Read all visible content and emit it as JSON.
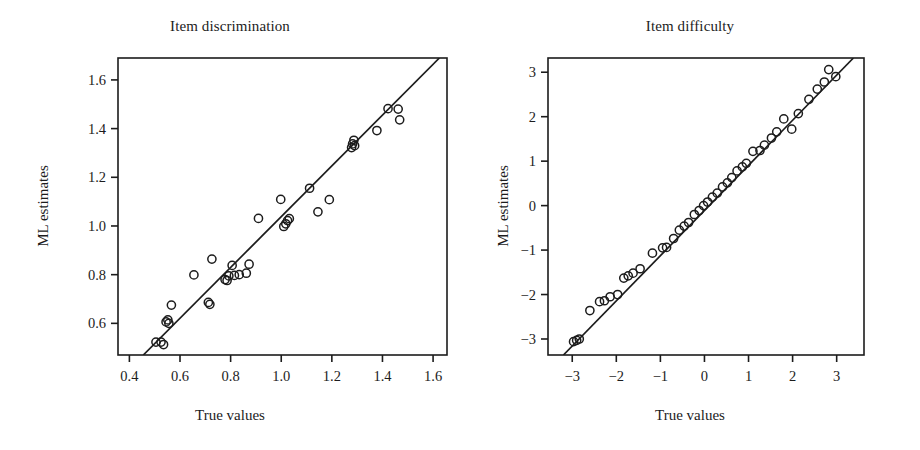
{
  "figure": {
    "width": 920,
    "height": 450,
    "background": "#ffffff",
    "ink_color": "#1c1c1c"
  },
  "panels": {
    "left": {
      "title": "Item discrimination",
      "xlabel": "True values",
      "ylabel": "ML estimates"
    },
    "right": {
      "title": "Item difficulty",
      "xlabel": "True values",
      "ylabel": "ML estimates"
    }
  },
  "chart_data": [
    {
      "type": "scatter",
      "title": "Item discrimination",
      "xlabel": "True values",
      "ylabel": "ML estimates",
      "xlim": [
        0.355,
        1.655
      ],
      "ylim": [
        0.47,
        1.69
      ],
      "xticks": [
        0.4,
        0.6,
        0.8,
        1.0,
        1.2,
        1.4,
        1.6
      ],
      "xticklabels": [
        "0.4",
        "0.6",
        "0.8",
        "1.0",
        "1.2",
        "1.4",
        "1.6"
      ],
      "yticks": [
        0.6,
        0.8,
        1.0,
        1.2,
        1.4,
        1.6
      ],
      "yticklabels": [
        "0.6",
        "0.8",
        "1.0",
        "1.2",
        "1.4",
        "1.6"
      ],
      "grid": false,
      "legend": "none",
      "marker": "open-circle",
      "reference_line": {
        "kind": "identity-fit",
        "x0": 0.455,
        "y0": 0.47,
        "x1": 1.625,
        "y1": 1.69
      },
      "points": [
        {
          "x": 0.505,
          "y": 0.523
        },
        {
          "x": 0.525,
          "y": 0.523
        },
        {
          "x": 0.535,
          "y": 0.513
        },
        {
          "x": 0.545,
          "y": 0.606
        },
        {
          "x": 0.552,
          "y": 0.614
        },
        {
          "x": 0.556,
          "y": 0.6
        },
        {
          "x": 0.566,
          "y": 0.675
        },
        {
          "x": 0.655,
          "y": 0.799
        },
        {
          "x": 0.712,
          "y": 0.686
        },
        {
          "x": 0.718,
          "y": 0.678
        },
        {
          "x": 0.726,
          "y": 0.864
        },
        {
          "x": 0.778,
          "y": 0.78
        },
        {
          "x": 0.786,
          "y": 0.776
        },
        {
          "x": 0.793,
          "y": 0.795
        },
        {
          "x": 0.806,
          "y": 0.838
        },
        {
          "x": 0.815,
          "y": 0.797
        },
        {
          "x": 0.834,
          "y": 0.8
        },
        {
          "x": 0.862,
          "y": 0.806
        },
        {
          "x": 0.873,
          "y": 0.843
        },
        {
          "x": 0.91,
          "y": 1.031
        },
        {
          "x": 0.998,
          "y": 1.109
        },
        {
          "x": 1.01,
          "y": 0.998
        },
        {
          "x": 1.018,
          "y": 1.009
        },
        {
          "x": 1.025,
          "y": 1.022
        },
        {
          "x": 1.032,
          "y": 1.03
        },
        {
          "x": 1.112,
          "y": 1.155
        },
        {
          "x": 1.145,
          "y": 1.058
        },
        {
          "x": 1.19,
          "y": 1.108
        },
        {
          "x": 1.278,
          "y": 1.322
        },
        {
          "x": 1.282,
          "y": 1.337
        },
        {
          "x": 1.287,
          "y": 1.352
        },
        {
          "x": 1.29,
          "y": 1.33
        },
        {
          "x": 1.378,
          "y": 1.392
        },
        {
          "x": 1.422,
          "y": 1.482
        },
        {
          "x": 1.462,
          "y": 1.48
        },
        {
          "x": 1.468,
          "y": 1.436
        }
      ]
    },
    {
      "type": "scatter",
      "title": "Item difficulty",
      "xlabel": "True values",
      "ylabel": "ML estimates",
      "xlim": [
        -3.55,
        3.62
      ],
      "ylim": [
        -3.36,
        3.32
      ],
      "xticks": [
        -3,
        -2,
        -1,
        0,
        1,
        2,
        3
      ],
      "xticklabels": [
        "−3",
        "−2",
        "−1",
        "0",
        "1",
        "2",
        "3"
      ],
      "yticks": [
        -3,
        -2,
        -1,
        0,
        1,
        2,
        3
      ],
      "yticklabels": [
        "−3",
        "−2",
        "−1",
        "0",
        "1",
        "2",
        "3"
      ],
      "grid": false,
      "legend": "none",
      "marker": "open-circle",
      "reference_line": {
        "kind": "identity-fit",
        "x0": -3.2,
        "y0": -3.36,
        "x1": 3.38,
        "y1": 3.32
      },
      "points": [
        {
          "x": -2.97,
          "y": -3.06
        },
        {
          "x": -2.9,
          "y": -3.03
        },
        {
          "x": -2.84,
          "y": -3.0
        },
        {
          "x": -2.6,
          "y": -2.36
        },
        {
          "x": -2.38,
          "y": -2.16
        },
        {
          "x": -2.27,
          "y": -2.14
        },
        {
          "x": -2.14,
          "y": -2.05
        },
        {
          "x": -1.97,
          "y": -2.0
        },
        {
          "x": -1.83,
          "y": -1.63
        },
        {
          "x": -1.73,
          "y": -1.58
        },
        {
          "x": -1.62,
          "y": -1.52
        },
        {
          "x": -1.46,
          "y": -1.42
        },
        {
          "x": -1.18,
          "y": -1.07
        },
        {
          "x": -0.95,
          "y": -0.95
        },
        {
          "x": -0.86,
          "y": -0.94
        },
        {
          "x": -0.7,
          "y": -0.74
        },
        {
          "x": -0.57,
          "y": -0.55
        },
        {
          "x": -0.46,
          "y": -0.46
        },
        {
          "x": -0.36,
          "y": -0.38
        },
        {
          "x": -0.23,
          "y": -0.2
        },
        {
          "x": -0.12,
          "y": -0.11
        },
        {
          "x": -0.02,
          "y": 0.0
        },
        {
          "x": 0.07,
          "y": 0.08
        },
        {
          "x": 0.18,
          "y": 0.19
        },
        {
          "x": 0.29,
          "y": 0.28
        },
        {
          "x": 0.41,
          "y": 0.42
        },
        {
          "x": 0.52,
          "y": 0.51
        },
        {
          "x": 0.62,
          "y": 0.63
        },
        {
          "x": 0.74,
          "y": 0.78
        },
        {
          "x": 0.86,
          "y": 0.87
        },
        {
          "x": 0.95,
          "y": 0.95
        },
        {
          "x": 1.1,
          "y": 1.22
        },
        {
          "x": 1.26,
          "y": 1.24
        },
        {
          "x": 1.36,
          "y": 1.36
        },
        {
          "x": 1.52,
          "y": 1.52
        },
        {
          "x": 1.64,
          "y": 1.66
        },
        {
          "x": 1.8,
          "y": 1.95
        },
        {
          "x": 1.98,
          "y": 1.72
        },
        {
          "x": 2.13,
          "y": 2.07
        },
        {
          "x": 2.37,
          "y": 2.39
        },
        {
          "x": 2.56,
          "y": 2.62
        },
        {
          "x": 2.72,
          "y": 2.78
        },
        {
          "x": 2.82,
          "y": 3.06
        },
        {
          "x": 2.98,
          "y": 2.9
        }
      ]
    }
  ]
}
